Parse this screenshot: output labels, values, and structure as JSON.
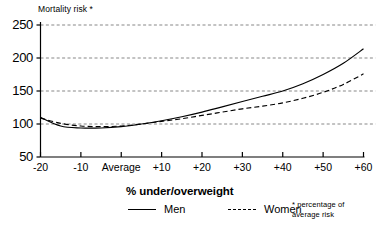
{
  "chart_data": {
    "type": "line",
    "title": "Mortality risk *",
    "xlabel": "% under/overweight",
    "ylabel": "Mortality risk *",
    "footnote": "* percentage of\naverage risk",
    "grid": true,
    "legend_position": "bottom",
    "xlim": [
      -20,
      60
    ],
    "ylim": [
      50,
      250
    ],
    "x_tick_labels": [
      "-20",
      "-10",
      "Average",
      "+10",
      "+20",
      "+30",
      "+40",
      "+50",
      "+60"
    ],
    "x_tick_values": [
      -20,
      -10,
      0,
      10,
      20,
      30,
      40,
      50,
      60
    ],
    "y_tick_labels": [
      "250",
      "200",
      "150",
      "100",
      "50"
    ],
    "y_tick_values": [
      250,
      200,
      150,
      100,
      50
    ],
    "gridlines": [
      250,
      200,
      150,
      100
    ],
    "reference_line": 100,
    "x": [
      -20,
      -15,
      -10,
      -5,
      0,
      5,
      10,
      15,
      20,
      25,
      30,
      35,
      40,
      45,
      50,
      55,
      60
    ],
    "series": [
      {
        "name": "Men",
        "style": "solid",
        "color": "#000000",
        "values": [
          110,
          97,
          94,
          94,
          96,
          100,
          105,
          111,
          118,
          126,
          134,
          142,
          150,
          161,
          175,
          192,
          214
        ]
      },
      {
        "name": "Women",
        "style": "dashed",
        "color": "#000000",
        "values": [
          109,
          101,
          97,
          96,
          97,
          100,
          104,
          108,
          113,
          118,
          123,
          127,
          132,
          139,
          148,
          160,
          176
        ]
      }
    ]
  },
  "legend": {
    "items": [
      {
        "label": "Men",
        "style": "solid"
      },
      {
        "label": "Women",
        "style": "dashed"
      }
    ]
  }
}
